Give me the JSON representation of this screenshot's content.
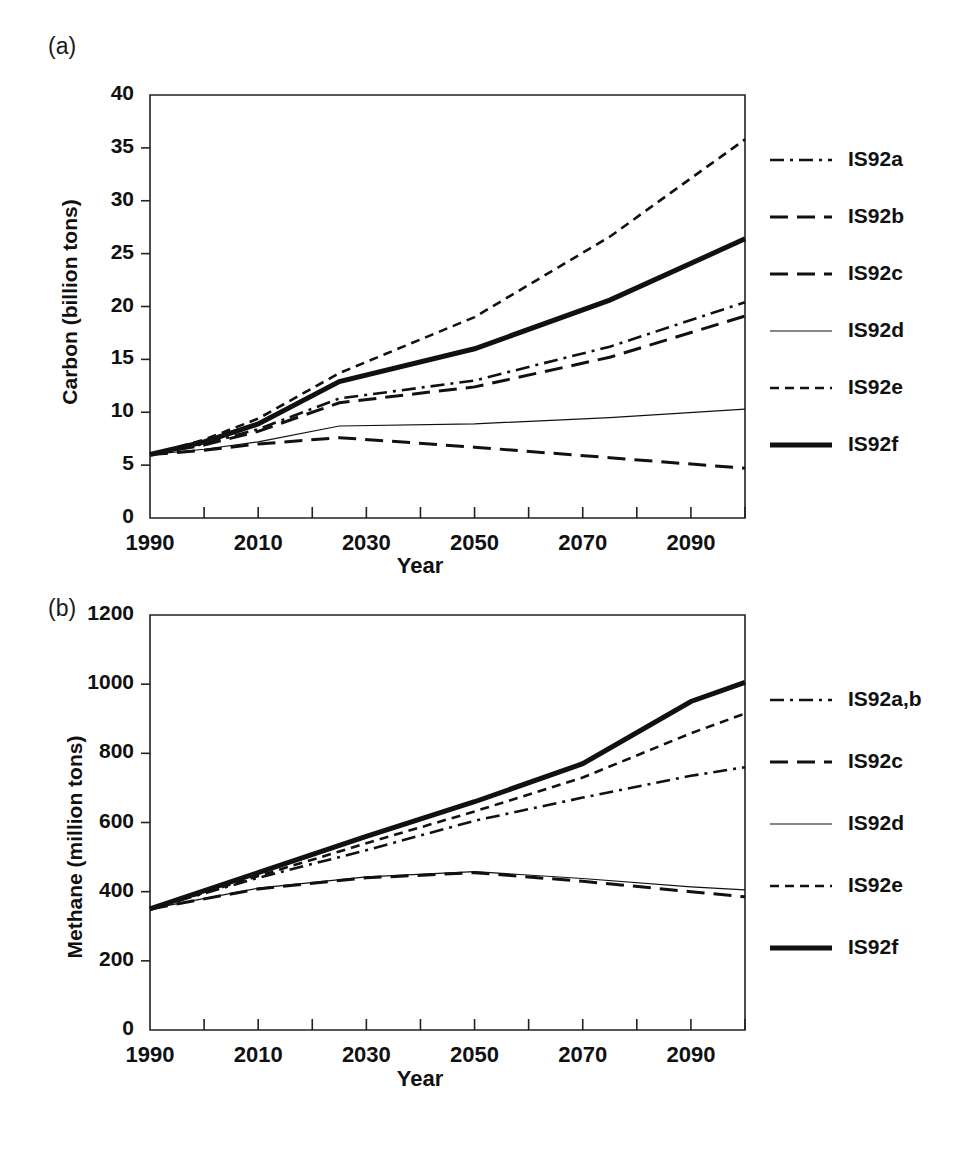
{
  "figure": {
    "panel_a_label": "(a)",
    "panel_b_label": "(b)"
  },
  "chart_data": [
    {
      "panel": "(a)",
      "type": "line",
      "title": "",
      "xlabel": "Year",
      "ylabel": "Carbon (billion tons)",
      "xlim": [
        1990,
        2100
      ],
      "ylim": [
        0,
        40
      ],
      "ytick_labels": [
        "0",
        "5",
        "10",
        "15",
        "20",
        "25",
        "30",
        "35",
        "40"
      ],
      "yticks": [
        0,
        5,
        10,
        15,
        20,
        25,
        30,
        35,
        40
      ],
      "xtick_labels": [
        "1990",
        "2010",
        "2030",
        "2050",
        "2070",
        "2090"
      ],
      "xticks": [
        1990,
        2010,
        2030,
        2050,
        2070,
        2090
      ],
      "xminor_step": 10,
      "grid": false,
      "legend_position": "right",
      "x": [
        1990,
        2000,
        2010,
        2025,
        2050,
        2075,
        2100
      ],
      "series": [
        {
          "name": "IS92a",
          "style": "dash-dot",
          "width": 2.6,
          "values": [
            6.0,
            7.0,
            8.4,
            11.3,
            13.0,
            16.2,
            20.4
          ]
        },
        {
          "name": "IS92b",
          "style": "long-dash",
          "width": 3.0,
          "values": [
            6.0,
            6.9,
            8.2,
            10.9,
            12.4,
            15.2,
            19.1
          ]
        },
        {
          "name": "IS92c",
          "style": "long-dash",
          "width": 3.0,
          "values": [
            6.0,
            6.4,
            7.0,
            7.6,
            6.7,
            5.7,
            4.7
          ]
        },
        {
          "name": "IS92d",
          "style": "thin-solid",
          "width": 1.2,
          "values": [
            6.0,
            6.5,
            7.2,
            8.7,
            8.9,
            9.5,
            10.3
          ]
        },
        {
          "name": "IS92e",
          "style": "short-dash",
          "width": 2.6,
          "values": [
            6.0,
            7.4,
            9.4,
            13.7,
            19.0,
            26.6,
            35.8
          ]
        },
        {
          "name": "IS92f",
          "style": "thick-solid",
          "width": 5.0,
          "values": [
            6.0,
            7.2,
            8.9,
            12.9,
            16.0,
            20.6,
            26.4
          ]
        }
      ],
      "legend": [
        {
          "label": "IS92a",
          "style": "dash-dot"
        },
        {
          "label": "IS92b",
          "style": "long-dash"
        },
        {
          "label": "IS92c",
          "style": "long-dash"
        },
        {
          "label": "IS92d",
          "style": "thin-solid"
        },
        {
          "label": "IS92e",
          "style": "short-dash"
        },
        {
          "label": "IS92f",
          "style": "thick-solid"
        }
      ]
    },
    {
      "panel": "(b)",
      "type": "line",
      "title": "",
      "xlabel": "Year",
      "ylabel": "Methane (million tons)",
      "xlim": [
        1990,
        2100
      ],
      "ylim": [
        0,
        1200
      ],
      "ytick_labels": [
        "0",
        "200",
        "400",
        "600",
        "800",
        "1000",
        "1200"
      ],
      "yticks": [
        0,
        200,
        400,
        600,
        800,
        1000,
        1200
      ],
      "xtick_labels": [
        "1990",
        "2010",
        "2030",
        "2050",
        "2070",
        "2090"
      ],
      "xticks": [
        1990,
        2010,
        2030,
        2050,
        2070,
        2090
      ],
      "xminor_step": 10,
      "grid": false,
      "legend_position": "right",
      "x": [
        1990,
        2010,
        2030,
        2050,
        2070,
        2090,
        2100
      ],
      "series": [
        {
          "name": "IS92a,b",
          "style": "dash-dot",
          "width": 2.6,
          "values": [
            350,
            440,
            520,
            605,
            672,
            735,
            760
          ]
        },
        {
          "name": "IS92c",
          "style": "long-dash",
          "width": 3.0,
          "values": [
            350,
            408,
            440,
            455,
            430,
            400,
            385
          ]
        },
        {
          "name": "IS92d",
          "style": "thin-solid",
          "width": 1.2,
          "values": [
            350,
            410,
            443,
            458,
            438,
            414,
            405
          ]
        },
        {
          "name": "IS92e",
          "style": "short-dash",
          "width": 2.6,
          "values": [
            350,
            445,
            540,
            632,
            730,
            858,
            915
          ]
        },
        {
          "name": "IS92f",
          "style": "thick-solid",
          "width": 5.0,
          "values": [
            350,
            455,
            560,
            660,
            770,
            950,
            1005
          ]
        }
      ],
      "legend": [
        {
          "label": "IS92a,b",
          "style": "dash-dot"
        },
        {
          "label": "IS92c",
          "style": "long-dash"
        },
        {
          "label": "IS92d",
          "style": "thin-solid"
        },
        {
          "label": "IS92e",
          "style": "short-dash"
        },
        {
          "label": "IS92f",
          "style": "thick-solid"
        }
      ]
    }
  ]
}
